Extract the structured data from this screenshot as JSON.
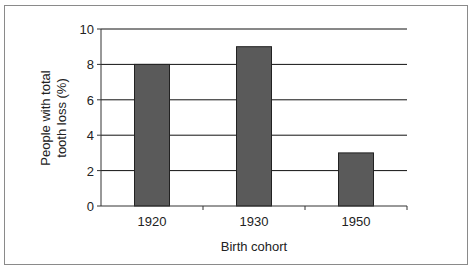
{
  "chart_data": {
    "type": "bar",
    "title": "",
    "xlabel": "Birth cohort",
    "ylabel_lines": [
      "People with total",
      "tooth loss (%)"
    ],
    "ylabel": "People with total tooth loss (%)",
    "categories": [
      "1920",
      "1930",
      "1950"
    ],
    "values": [
      8,
      9,
      3
    ],
    "ylim": [
      0,
      10
    ],
    "yticks": [
      0,
      2,
      4,
      6,
      8,
      10
    ],
    "grid": true,
    "legend": "none",
    "colors": {
      "bar": "#5a5a5a",
      "bar_edge": "#222222",
      "grid": "#111111"
    }
  }
}
